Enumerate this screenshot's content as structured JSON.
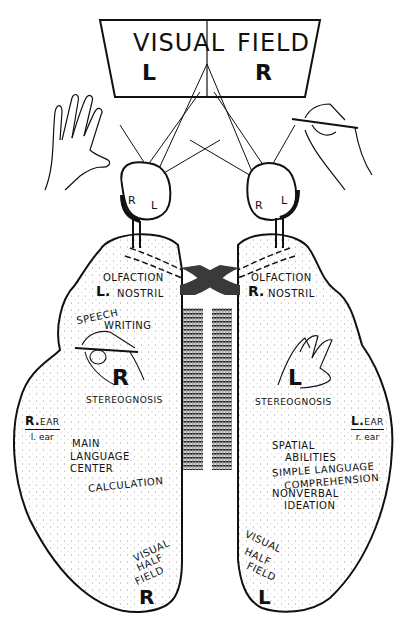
{
  "visual_field": {
    "left_word": "VISUAL",
    "right_word": "FIELD",
    "left_letter": "L",
    "right_letter": "R"
  },
  "eyes": {
    "left_eye": {
      "r": "R",
      "l": "L"
    },
    "right_eye": {
      "r": "R",
      "l": "L"
    }
  },
  "left_hemisphere": {
    "olfaction": "OLFACTION",
    "nostril_letter": "L.",
    "nostril": "NOSTRIL",
    "speech": "SPEECH",
    "writing": "WRITING",
    "hand_letter": "R",
    "stereognosis": "STEREOGNOSIS",
    "ear_letter": "R.",
    "ear_main": "EAR",
    "ear_sub": "l. ear",
    "functions": [
      "MAIN",
      "LANGUAGE",
      "CENTER",
      "CALCULATION"
    ],
    "visual_half": [
      "VISUAL",
      "HALF",
      "FIELD"
    ],
    "visual_letter": "R"
  },
  "right_hemisphere": {
    "olfaction": "OLFACTION",
    "nostril_letter": "R.",
    "nostril": "NOSTRIL",
    "hand_letter": "L",
    "stereognosis": "STEREOGNOSIS",
    "ear_letter": "L.",
    "ear_main": "EAR",
    "ear_sub": "r. ear",
    "functions": [
      "SPATIAL",
      "ABILITIES",
      "SIMPLE LANGUAGE",
      "COMPREHENSION",
      "NONVERBAL",
      "IDEATION"
    ],
    "visual_half": [
      "VISUAL",
      "HALF",
      "FIELD"
    ],
    "visual_letter": "L"
  },
  "colors": {
    "ink": "#111111",
    "paper": "#ffffff",
    "shade": "#3a3a3a"
  }
}
